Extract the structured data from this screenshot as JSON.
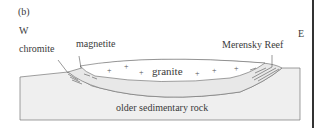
{
  "figure": {
    "panel_label": "(b)",
    "direction_west": "W",
    "direction_east": "E"
  },
  "labels": {
    "chromite": "chromite",
    "magnetite": "magnetite",
    "merensky_reef": "Merensky Reef",
    "granite": "granite",
    "older_sedimentary_rock": "older sedimentary rock"
  },
  "granite_symbols": [
    "+",
    "+",
    "+",
    "+",
    "+",
    "+"
  ],
  "colors": {
    "sediment_fill": "#eeeeee",
    "intrusion_fill": "#e6e6e6",
    "granite_fill": "#ffffff",
    "outline": "#666666",
    "right_bar": "#333333"
  }
}
